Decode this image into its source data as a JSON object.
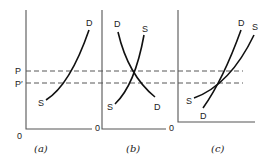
{
  "figure": {
    "price_labels": {
      "p": "P",
      "p_prime": "P′"
    },
    "origin_label": "0",
    "panels": [
      {
        "id": "a",
        "caption": "(a)",
        "curves": [
          {
            "label_start": "S",
            "label_end": "D"
          }
        ]
      },
      {
        "id": "b",
        "caption": "(b)",
        "curves": [
          {
            "label_start": "D",
            "label_end": "D",
            "name": "demand"
          },
          {
            "label_start": "S",
            "label_end": "S",
            "name": "supply"
          }
        ]
      },
      {
        "id": "c",
        "caption": "(c)",
        "curves": [
          {
            "label_start": "D",
            "label_end": "D",
            "name": "demand"
          },
          {
            "label_start": "S",
            "label_end": "S",
            "name": "supply"
          }
        ]
      }
    ]
  }
}
